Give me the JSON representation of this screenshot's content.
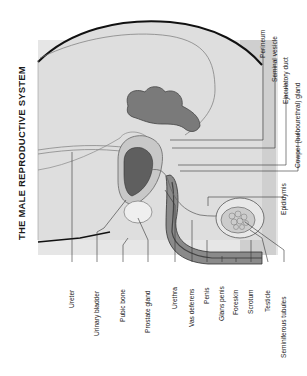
{
  "title": "THE MALE REPRODUCTIVE SYSTEM",
  "colors": {
    "background": "#ffffff",
    "body_fill": "#d9d9d9",
    "panel_fill": "#cfcfcf",
    "organ_dark": "#6e6e6e",
    "organ_mid": "#9a9a9a",
    "outline": "#111111",
    "leader_line": "#333333"
  },
  "labels_bottom": [
    {
      "id": "ureter",
      "text": "Ureter",
      "x": 72
    },
    {
      "id": "urinary-bladder",
      "text": "Urinary bladder",
      "x": 97
    },
    {
      "id": "pubic-bone",
      "text": "Pubic bone",
      "x": 123
    },
    {
      "id": "prostate-gland",
      "text": "Prostate gland",
      "x": 148
    },
    {
      "id": "urethra",
      "text": "Urethra",
      "x": 175
    },
    {
      "id": "vas-deferens",
      "text": "Vas deferens",
      "x": 192
    },
    {
      "id": "penis",
      "text": "Penis",
      "x": 207
    },
    {
      "id": "glans-penis",
      "text": "Glans penis",
      "x": 222
    },
    {
      "id": "foreskin",
      "text": "Foreskin",
      "x": 236
    },
    {
      "id": "scrotum",
      "text": "Scrotum",
      "x": 251
    },
    {
      "id": "testicle",
      "text": "Testicle",
      "x": 268
    },
    {
      "id": "seminiferous-tubules",
      "text": "Seminiferous tubules",
      "x": 284
    }
  ],
  "labels_right": [
    {
      "id": "perineum",
      "text": "Perineum",
      "x": 263
    },
    {
      "id": "seminal-vesicle",
      "text": "Seminal vesicle",
      "x": 275
    },
    {
      "id": "ejaculatory-duct",
      "text": "Ejaculatory duct",
      "x": 286
    },
    {
      "id": "cowper-gland",
      "text": "Cowper (bulbourethral) gland",
      "x": 298
    },
    {
      "id": "epididymis",
      "text": "Epididymis",
      "x": 284
    }
  ]
}
